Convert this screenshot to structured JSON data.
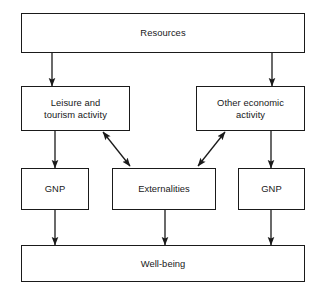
{
  "diagram": {
    "background_color": "#ffffff",
    "line_color": "#1a1a1a",
    "text_color": "#17181a",
    "nodes": [
      {
        "id": "resources",
        "label": "Resources",
        "x": 21,
        "y": 13,
        "w": 284,
        "h": 40
      },
      {
        "id": "leisure",
        "label": "Leisure and\ntourism activity",
        "x": 21,
        "y": 86,
        "w": 109,
        "h": 45
      },
      {
        "id": "other-economic",
        "label": "Other economic\nactivity",
        "x": 196,
        "y": 86,
        "w": 109,
        "h": 45
      },
      {
        "id": "gnp-left",
        "label": "GNP",
        "x": 21,
        "y": 168,
        "w": 68,
        "h": 42
      },
      {
        "id": "externalities",
        "label": "Externalities",
        "x": 112,
        "y": 168,
        "w": 104,
        "h": 42
      },
      {
        "id": "gnp-right",
        "label": "GNP",
        "x": 238,
        "y": 168,
        "w": 67,
        "h": 42
      },
      {
        "id": "well-being",
        "label": "Well-being",
        "x": 21,
        "y": 245,
        "w": 284,
        "h": 37
      }
    ],
    "connectors": [
      {
        "id": "resources-to-leisure",
        "from": "resources",
        "to": "leisure",
        "kind": "vertical-arrow",
        "x1": 52,
        "y1": 53,
        "x2": 52,
        "y2": 86
      },
      {
        "id": "resources-to-other-economic",
        "from": "resources",
        "to": "other-economic",
        "kind": "vertical-arrow",
        "x1": 272,
        "y1": 53,
        "x2": 272,
        "y2": 86
      },
      {
        "id": "leisure-to-gnp-left",
        "from": "leisure",
        "to": "gnp-left",
        "kind": "vertical-arrow",
        "x1": 55,
        "y1": 131,
        "x2": 55,
        "y2": 168
      },
      {
        "id": "other-economic-to-gnp-right",
        "from": "other-economic",
        "to": "gnp-right",
        "kind": "vertical-arrow",
        "x1": 271,
        "y1": 131,
        "x2": 271,
        "y2": 168
      },
      {
        "id": "leisure-externalities-bidirect",
        "from": "leisure",
        "to": "externalities",
        "kind": "double-arrow",
        "x1": 103,
        "y1": 132,
        "x2": 130,
        "y2": 166
      },
      {
        "id": "other-externalities-bidirect",
        "from": "externalities",
        "to": "other-economic",
        "kind": "double-arrow",
        "x1": 198,
        "y1": 166,
        "x2": 225,
        "y2": 132
      },
      {
        "id": "gnp-left-to-well-being",
        "from": "gnp-left",
        "to": "well-being",
        "kind": "vertical-arrow",
        "x1": 55,
        "y1": 210,
        "x2": 55,
        "y2": 245
      },
      {
        "id": "externalities-to-well-being",
        "from": "externalities",
        "to": "well-being",
        "kind": "vertical-arrow",
        "x1": 165,
        "y1": 210,
        "x2": 165,
        "y2": 245
      },
      {
        "id": "gnp-right-to-well-being",
        "from": "gnp-right",
        "to": "well-being",
        "kind": "vertical-arrow",
        "x1": 271,
        "y1": 210,
        "x2": 271,
        "y2": 245
      }
    ]
  }
}
